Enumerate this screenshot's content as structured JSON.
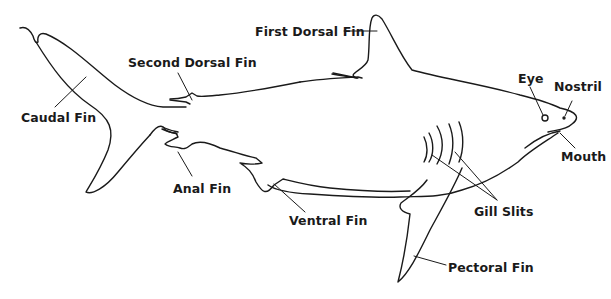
{
  "diagram": {
    "line_color": "#1a1a1a",
    "background": "#ffffff",
    "labels": {
      "first_dorsal_fin": "First Dorsal Fin",
      "second_dorsal_fin": "Second Dorsal Fin",
      "caudal_fin": "Caudal Fin",
      "eye": "Eye",
      "nostril": "Nostril",
      "mouth": "Mouth",
      "anal_fin": "Anal Fin",
      "ventral_fin": "Ventral Fin",
      "gill_slits": "Gill Slits",
      "pectoral_fin": "Pectoral Fin"
    }
  }
}
